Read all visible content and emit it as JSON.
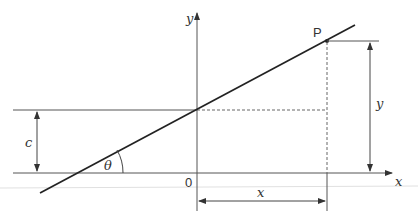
{
  "diagram": {
    "labels": {
      "y_axis": "y",
      "x_axis": "x",
      "origin": "0",
      "point": "P",
      "intercept": "c",
      "angle": "θ",
      "horizontal_distance": "x",
      "vertical_distance": "y"
    },
    "colors": {
      "line": "#222222",
      "axis": "#555555",
      "dashed": "#666666",
      "text": "#333333",
      "faint": "#dddddd"
    }
  }
}
